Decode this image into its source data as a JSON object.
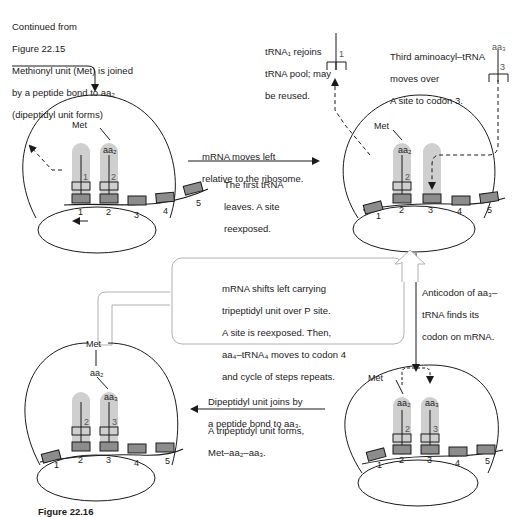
{
  "colors": {
    "line": "#1a1a1a",
    "trna_shade": "#cfcfcf",
    "codon_fill": "#8c8c8c",
    "box_outline": "#b0b0b0"
  },
  "intro_note": {
    "line1": "Continued from",
    "line2": "Figure 22.15",
    "line3": "Methionyl unit (Met) is joined",
    "line4": "by a peptide bond to aa₂",
    "line5": "(dipeptidyl unit forms)"
  },
  "step1": {
    "met": "Met",
    "aa2": "aa₂",
    "trna1_num": "1",
    "trna2_num": "2",
    "codons": [
      "1",
      "2",
      "3",
      "4",
      "5"
    ]
  },
  "arrow_top": {
    "above_line1": "mRNA moves left",
    "above_line2": "relative to the ribosome.",
    "below_line1": "The first tRNA",
    "below_line2": "leaves.  A site",
    "below_line3": "reexposed."
  },
  "trna_pool_note": {
    "line1": "tRNA₁ rejoins",
    "line2": "tRNA pool; may",
    "line3": "be reused.",
    "trna_num": "1"
  },
  "third_aminoacyl_note": {
    "line1": "Third aminoacyl–tRNA",
    "line2": "moves over",
    "line3": "A site to codon 3.",
    "aa3": "aa₃",
    "trna_num": "3"
  },
  "step2": {
    "met": "Met",
    "aa2": "aa₂",
    "trna2_num": "2",
    "codons": [
      "1",
      "2",
      "3",
      "4",
      "5"
    ]
  },
  "arrow_right": {
    "line1": "Anticodon of aa₃–",
    "line2": "tRNA finds its",
    "line3": "codon on mRNA."
  },
  "center_box": {
    "line1": "mRNA shifts left carrying",
    "line2": "tripeptidyl unit over P site.",
    "line3": "A site is reexposed.  Then,",
    "line4": "aa₄–tRNA₄ moves to codon 4",
    "line5": "and cycle of steps repeats."
  },
  "step3": {
    "met": "Met",
    "aa2": "aa₂",
    "aa3": "aa₃",
    "trna2_num": "2",
    "trna3_num": "3",
    "codons": [
      "1",
      "2",
      "3",
      "4",
      "5"
    ]
  },
  "arrow_bottom": {
    "above_line1": "Dipeptidyl unit joins by",
    "above_line2": "a peptide bond to aa₃.",
    "below_line1": "A tripeptidyl unit forms,",
    "below_line2": "Met–aa₂–aa₃."
  },
  "step4": {
    "met": "Met",
    "aa2": "aa₂",
    "aa3": "aa₃",
    "trna2_num": "2",
    "trna3_num": "3",
    "codons": [
      "1",
      "2",
      "3",
      "4",
      "5"
    ]
  },
  "caption": {
    "label": "Figure 22.16"
  }
}
